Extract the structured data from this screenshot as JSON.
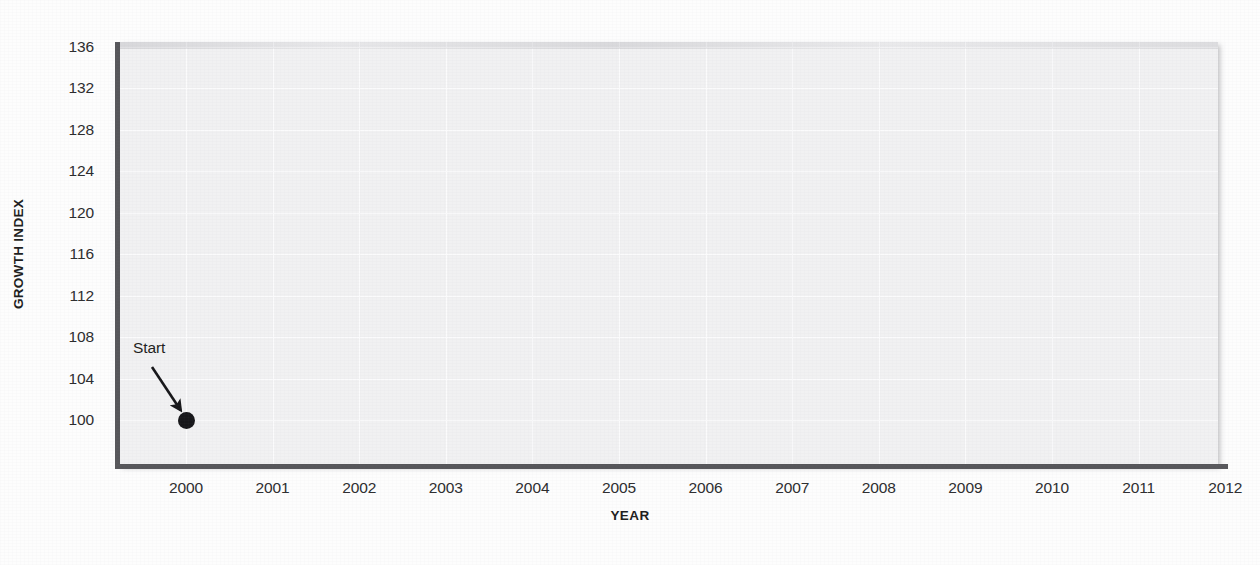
{
  "chart_data": {
    "type": "scatter",
    "title": "",
    "xlabel": "YEAR",
    "ylabel": "GROWTH INDEX",
    "xlim": [
      2000,
      2012
    ],
    "ylim": [
      98,
      136
    ],
    "grid": true,
    "legend": null,
    "x_ticks": [
      "2000",
      "2001",
      "2002",
      "2003",
      "2004",
      "2005",
      "2006",
      "2007",
      "2008",
      "2009",
      "2010",
      "2011",
      "2012"
    ],
    "y_ticks": [
      "100",
      "104",
      "108",
      "112",
      "116",
      "120",
      "124",
      "128",
      "132",
      "136"
    ],
    "series": [
      {
        "name": "Growth index",
        "marker": "filled-circle",
        "color": "#17171a",
        "points": [
          {
            "x": 2000,
            "y": 100
          }
        ]
      }
    ],
    "annotations": [
      {
        "text": "Start",
        "target_x": 2000,
        "target_y": 100,
        "arrow": true
      }
    ]
  },
  "axes": {
    "y_title": "GROWTH INDEX",
    "x_title": "YEAR",
    "axis_color": "#57575b",
    "panel_color": "#f1f1f2",
    "gridline_color": "#fbfbfc"
  },
  "annotation": {
    "start_label": "Start"
  }
}
